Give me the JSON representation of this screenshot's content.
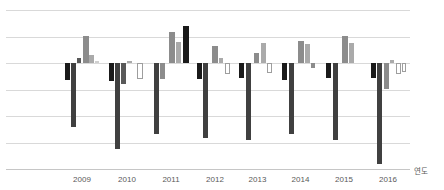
{
  "chart_data": {
    "type": "bar",
    "title": "",
    "xlabel": "연도",
    "ylabel": "",
    "categories": [
      "2009",
      "2010",
      "2011",
      "2012",
      "2013",
      "2014",
      "2015",
      "2016"
    ],
    "axis_range_units": [
      -4,
      2
    ],
    "grid": "horizontal-only",
    "legend": "none",
    "y_tick_labels_visible": false,
    "layout_px": {
      "baseline_y": 63,
      "unit_px": 26.5,
      "gridlines_y": [
        10,
        36.5,
        63,
        89.5,
        116,
        142.5
      ],
      "axis_y": 168.5,
      "plot_x_start": 6,
      "plot_x_end": 410,
      "tick_x": [
        82,
        127,
        171,
        215,
        257.5,
        300.5,
        344,
        388
      ],
      "tick_label_y": 175
    },
    "palette": {
      "black": "#1a1a1a",
      "charcoal": "#404040",
      "dgray": "#595959",
      "gray": "#8c8c8c",
      "lightgray": "#aaaaaa",
      "verylight": "#cfcfcf",
      "white": "#ffffff"
    },
    "groups": [
      {
        "year": "2009",
        "bars": [
          {
            "x": 65,
            "w": 5,
            "color": "black",
            "px": -17,
            "value_units": -0.64
          },
          {
            "x": 71,
            "w": 5,
            "color": "charcoal",
            "px": -64,
            "value_units": -2.42
          },
          {
            "x": 77,
            "w": 4,
            "color": "dgray",
            "px": 5,
            "value_units": 0.19
          },
          {
            "x": 82.5,
            "w": 6,
            "color": "gray",
            "px": 27,
            "value_units": 1.02
          },
          {
            "x": 89,
            "w": 5,
            "color": "lightgray",
            "px": 8,
            "value_units": 0.3
          },
          {
            "x": 95,
            "w": 4,
            "color": "verylight",
            "px": 2,
            "value_units": 0.08
          }
        ]
      },
      {
        "year": "2010",
        "bars": [
          {
            "x": 109,
            "w": 5,
            "color": "black",
            "px": -17.5,
            "value_units": -0.66
          },
          {
            "x": 115,
            "w": 5,
            "color": "charcoal",
            "px": -86,
            "value_units": -3.25
          },
          {
            "x": 121,
            "w": 5,
            "color": "dgray",
            "px": -20.5,
            "value_units": -0.77
          },
          {
            "x": 127,
            "w": 5,
            "color": "lightgray",
            "px": 2,
            "value_units": 0.08
          },
          {
            "x": 137,
            "w": 6,
            "color": "white",
            "px": -15.5,
            "value_units": -0.58
          }
        ]
      },
      {
        "year": "2011",
        "bars": [
          {
            "x": 154,
            "w": 5,
            "color": "charcoal",
            "px": -71,
            "value_units": -2.68
          },
          {
            "x": 160,
            "w": 5,
            "color": "gray",
            "px": -15.5,
            "value_units": -0.58
          },
          {
            "x": 169,
            "w": 6,
            "color": "gray",
            "px": 31.5,
            "value_units": 1.19
          },
          {
            "x": 176,
            "w": 5,
            "color": "lightgray",
            "px": 21.5,
            "value_units": 0.81
          },
          {
            "x": 182.5,
            "w": 6,
            "color": "black",
            "px": 37,
            "value_units": 1.4
          }
        ]
      },
      {
        "year": "2012",
        "bars": [
          {
            "x": 196.5,
            "w": 5,
            "color": "black",
            "px": -15.5,
            "value_units": -0.58
          },
          {
            "x": 202.5,
            "w": 5,
            "color": "charcoal",
            "px": -74.5,
            "value_units": -2.81
          },
          {
            "x": 212,
            "w": 6,
            "color": "gray",
            "px": 17.5,
            "value_units": 0.66
          },
          {
            "x": 219,
            "w": 4,
            "color": "lightgray",
            "px": 5.5,
            "value_units": 0.21
          },
          {
            "x": 224.5,
            "w": 5,
            "color": "white",
            "px": -10.5,
            "value_units": -0.4
          }
        ]
      },
      {
        "year": "2013",
        "bars": [
          {
            "x": 239,
            "w": 5,
            "color": "black",
            "px": -14.5,
            "value_units": -0.55
          },
          {
            "x": 245.5,
            "w": 5,
            "color": "charcoal",
            "px": -77,
            "value_units": -2.91
          },
          {
            "x": 254,
            "w": 5,
            "color": "gray",
            "px": 10,
            "value_units": 0.38
          },
          {
            "x": 260.5,
            "w": 5,
            "color": "lightgray",
            "px": 20,
            "value_units": 0.75
          },
          {
            "x": 267,
            "w": 5,
            "color": "white",
            "px": -9.5,
            "value_units": -0.36
          }
        ]
      },
      {
        "year": "2014",
        "bars": [
          {
            "x": 282,
            "w": 5,
            "color": "black",
            "px": -16.5,
            "value_units": -0.62
          },
          {
            "x": 288.5,
            "w": 5,
            "color": "charcoal",
            "px": -70.5,
            "value_units": -2.66
          },
          {
            "x": 297.5,
            "w": 6,
            "color": "gray",
            "px": 22.5,
            "value_units": 0.85
          },
          {
            "x": 304.5,
            "w": 5,
            "color": "lightgray",
            "px": 19.5,
            "value_units": 0.74
          },
          {
            "x": 310.5,
            "w": 4,
            "color": "gray",
            "px": -4.5,
            "value_units": -0.17
          }
        ]
      },
      {
        "year": "2015",
        "bars": [
          {
            "x": 326,
            "w": 5,
            "color": "black",
            "px": -14.5,
            "value_units": -0.55
          },
          {
            "x": 332.5,
            "w": 5,
            "color": "charcoal",
            "px": -76.5,
            "value_units": -2.89
          },
          {
            "x": 341.5,
            "w": 6,
            "color": "gray",
            "px": 27.5,
            "value_units": 1.04
          },
          {
            "x": 348.5,
            "w": 5,
            "color": "lightgray",
            "px": 20,
            "value_units": 0.75
          }
        ]
      },
      {
        "year": "2016",
        "bars": [
          {
            "x": 370.5,
            "w": 5,
            "color": "black",
            "px": -14.5,
            "value_units": -0.55
          },
          {
            "x": 377,
            "w": 5,
            "color": "charcoal",
            "px": -100.5,
            "value_units": -3.79
          },
          {
            "x": 383.5,
            "w": 5,
            "color": "gray",
            "px": -25.5,
            "value_units": -0.96
          },
          {
            "x": 389.5,
            "w": 4,
            "color": "lightgray",
            "px": 3,
            "value_units": 0.11
          },
          {
            "x": 395.5,
            "w": 5,
            "color": "white",
            "px": -10.5,
            "value_units": -0.4
          },
          {
            "x": 401.5,
            "w": 4.5,
            "color": "white",
            "px": -9,
            "value_units": -0.34
          }
        ]
      }
    ]
  },
  "axis": {
    "year_label": "연도"
  }
}
